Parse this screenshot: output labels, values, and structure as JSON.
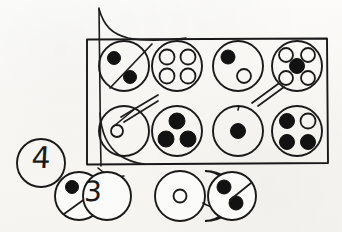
{
  "sheet": {
    "title": "Hand-drawn counting tokens diagram",
    "background_color": "#fbfbf9",
    "ink_color": "#1a1a1a",
    "width": 342,
    "height": 232
  },
  "box": {
    "label": "grouping-box",
    "x": 86,
    "y": 38,
    "width": 242,
    "height": 126,
    "stroke_color": "#1a1a1a"
  },
  "flourish": {
    "label": "curved-sweep-line",
    "description": "long hand-drawn curve entering from top and sweeping down past the bottom-left circle"
  },
  "tokens_in_box": [
    {
      "position": "row1-col1",
      "cx": 124,
      "cy": 66,
      "r": 25,
      "dots": [
        {
          "cx": 114,
          "cy": 58,
          "r": 6.5,
          "fill": "solid"
        },
        {
          "cx": 130,
          "cy": 77,
          "r": 6.5,
          "fill": "solid"
        }
      ],
      "dot_count": 2,
      "solid_count": 2,
      "open_count": 0,
      "slash_marks": 1
    },
    {
      "position": "row1-col2",
      "cx": 177,
      "cy": 66,
      "r": 25,
      "dots": [
        {
          "cx": 167,
          "cy": 57,
          "r": 7.5,
          "fill": "open"
        },
        {
          "cx": 188,
          "cy": 57,
          "r": 7.5,
          "fill": "open"
        },
        {
          "cx": 167,
          "cy": 76,
          "r": 7.5,
          "fill": "open"
        },
        {
          "cx": 188,
          "cy": 76,
          "r": 7.5,
          "fill": "open"
        }
      ],
      "dot_count": 4,
      "solid_count": 0,
      "open_count": 4,
      "slash_marks": 0
    },
    {
      "position": "row1-col3",
      "cx": 238,
      "cy": 66,
      "r": 25,
      "dots": [
        {
          "cx": 228,
          "cy": 57,
          "r": 7,
          "fill": "solid"
        },
        {
          "cx": 244,
          "cy": 76,
          "r": 7,
          "fill": "open"
        }
      ],
      "dot_count": 2,
      "solid_count": 1,
      "open_count": 1,
      "slash_marks": 0
    },
    {
      "position": "row1-col4",
      "cx": 297,
      "cy": 66,
      "r": 25,
      "dots": [
        {
          "cx": 286,
          "cy": 55,
          "r": 7,
          "fill": "open"
        },
        {
          "cx": 308,
          "cy": 55,
          "r": 7,
          "fill": "open"
        },
        {
          "cx": 286,
          "cy": 78,
          "r": 7,
          "fill": "open"
        },
        {
          "cx": 308,
          "cy": 78,
          "r": 7,
          "fill": "open"
        },
        {
          "cx": 297,
          "cy": 66,
          "r": 7.5,
          "fill": "solid"
        }
      ],
      "dot_count": 5,
      "solid_count": 1,
      "open_count": 4,
      "slash_marks": 0
    },
    {
      "position": "row2-col1",
      "cx": 124,
      "cy": 131,
      "r": 25,
      "dots": [
        {
          "cx": 117,
          "cy": 131,
          "r": 6,
          "fill": "open"
        }
      ],
      "dot_count": 1,
      "solid_count": 0,
      "open_count": 1,
      "slash_marks": 2
    },
    {
      "position": "row2-col2",
      "cx": 177,
      "cy": 131,
      "r": 25,
      "dots": [
        {
          "cx": 177,
          "cy": 121,
          "r": 8,
          "fill": "solid"
        },
        {
          "cx": 166,
          "cy": 139,
          "r": 8,
          "fill": "solid"
        },
        {
          "cx": 188,
          "cy": 139,
          "r": 8,
          "fill": "solid"
        }
      ],
      "dot_count": 3,
      "solid_count": 3,
      "open_count": 0,
      "slash_marks": 0
    },
    {
      "position": "row2-col3",
      "cx": 238,
      "cy": 131,
      "r": 25,
      "dots": [
        {
          "cx": 238,
          "cy": 131,
          "r": 7.5,
          "fill": "solid"
        }
      ],
      "dot_count": 1,
      "solid_count": 1,
      "open_count": 0,
      "slash_marks": 0
    },
    {
      "position": "row2-col4",
      "cx": 297,
      "cy": 131,
      "r": 25,
      "dots": [
        {
          "cx": 287,
          "cy": 121,
          "r": 7.5,
          "fill": "solid"
        },
        {
          "cx": 308,
          "cy": 121,
          "r": 7.5,
          "fill": "open"
        },
        {
          "cx": 287,
          "cy": 142,
          "r": 7.5,
          "fill": "solid"
        },
        {
          "cx": 308,
          "cy": 142,
          "r": 7.5,
          "fill": "solid"
        }
      ],
      "dot_count": 4,
      "solid_count": 3,
      "open_count": 1,
      "slash_marks": 0
    }
  ],
  "tokens_outside_box": [
    {
      "position": "numeral-four-token",
      "cx": 41,
      "cy": 163,
      "r": 24,
      "numeral": "4",
      "dots": [],
      "dot_count": 0,
      "slash_marks": 0
    },
    {
      "position": "lower-left-pair-back",
      "cx": 79,
      "cy": 196,
      "r": 24,
      "dots": [
        {
          "cx": 72,
          "cy": 187,
          "r": 6.5,
          "fill": "solid"
        }
      ],
      "dot_count": 1,
      "solid_count": 1,
      "open_count": 0,
      "slash_marks": 1
    },
    {
      "position": "lower-left-pair-front",
      "cx": 107,
      "cy": 196,
      "r": 24,
      "numeral": "3",
      "dots": [],
      "dot_count": 0,
      "slash_marks": 0
    },
    {
      "position": "lower-right-trio-back",
      "cx": 180,
      "cy": 196,
      "r": 25,
      "dots": [
        {
          "cx": 180,
          "cy": 196,
          "r": 6.5,
          "fill": "open"
        }
      ],
      "dot_count": 1,
      "solid_count": 0,
      "open_count": 1,
      "slash_marks": 0
    },
    {
      "position": "lower-right-trio-middle",
      "cx": 205,
      "cy": 196,
      "r": 25,
      "dots": [],
      "dot_count": 0,
      "solid_count": 0,
      "open_count": 0,
      "slash_marks": 0
    },
    {
      "position": "lower-right-trio-front",
      "cx": 232,
      "cy": 196,
      "r": 24,
      "dots": [
        {
          "cx": 224,
          "cy": 187,
          "r": 7,
          "fill": "solid"
        },
        {
          "cx": 236,
          "cy": 203,
          "r": 7,
          "fill": "solid"
        }
      ],
      "dot_count": 2,
      "solid_count": 2,
      "open_count": 0,
      "slash_marks": 1
    }
  ],
  "numerals": {
    "four": "4",
    "three": "3"
  },
  "tally_marks": [
    {
      "label": "tally-row1-col1",
      "count": 1
    },
    {
      "label": "tally-row2-col1",
      "count": 2
    },
    {
      "label": "tally-row1-col4-left",
      "count": 2
    },
    {
      "label": "tally-lower-left",
      "count": 1
    },
    {
      "label": "tally-lower-right",
      "count": 1
    }
  ]
}
